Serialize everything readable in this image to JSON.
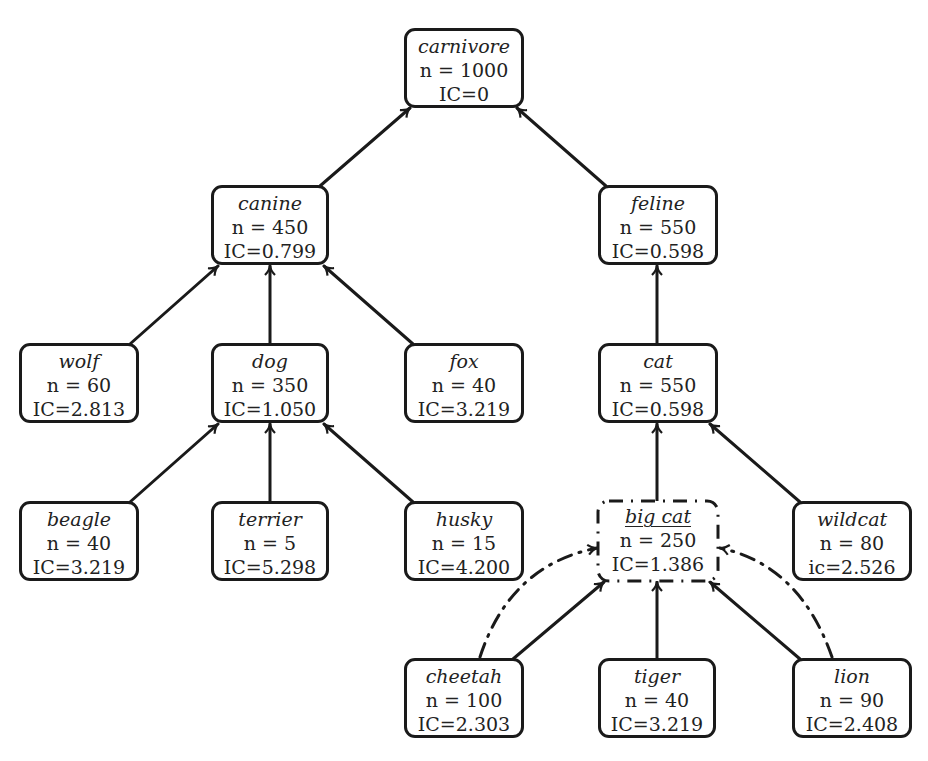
{
  "diagram": {
    "nodes": {
      "carnivore": {
        "name": "carnivore",
        "n": "n = 1000",
        "ic": "IC=0"
      },
      "canine": {
        "name": "canine",
        "n": "n = 450",
        "ic": "IC=0.799"
      },
      "feline": {
        "name": "feline",
        "n": "n = 550",
        "ic": "IC=0.598"
      },
      "wolf": {
        "name": "wolf",
        "n": "n = 60",
        "ic": "IC=2.813"
      },
      "dog": {
        "name": "dog",
        "n": "n = 350",
        "ic": "IC=1.050"
      },
      "fox": {
        "name": "fox",
        "n": "n = 40",
        "ic": "IC=3.219"
      },
      "cat": {
        "name": "cat",
        "n": "n = 550",
        "ic": "IC=0.598"
      },
      "beagle": {
        "name": "beagle",
        "n": "n = 40",
        "ic": "IC=3.219"
      },
      "terrier": {
        "name": "terrier",
        "n": "n = 5",
        "ic": "IC=5.298"
      },
      "husky": {
        "name": "husky",
        "n": "n = 15",
        "ic": "IC=4.200"
      },
      "big_cat": {
        "name": "big cat",
        "n": "n = 250",
        "ic": "IC=1.386"
      },
      "wildcat": {
        "name": "wildcat",
        "n": "n = 80",
        "ic": "ic=2.526"
      },
      "cheetah": {
        "name": "cheetah",
        "n": "n = 100",
        "ic": "IC=2.303"
      },
      "tiger": {
        "name": "tiger",
        "n": "n = 40",
        "ic": "IC=3.219"
      },
      "lion": {
        "name": "lion",
        "n": "n = 90",
        "ic": "IC=2.408"
      }
    },
    "edges": [
      {
        "from": "canine",
        "to": "carnivore",
        "style": "solid"
      },
      {
        "from": "feline",
        "to": "carnivore",
        "style": "solid"
      },
      {
        "from": "wolf",
        "to": "canine",
        "style": "solid"
      },
      {
        "from": "dog",
        "to": "canine",
        "style": "solid"
      },
      {
        "from": "fox",
        "to": "canine",
        "style": "solid"
      },
      {
        "from": "cat",
        "to": "feline",
        "style": "solid"
      },
      {
        "from": "beagle",
        "to": "dog",
        "style": "solid"
      },
      {
        "from": "terrier",
        "to": "dog",
        "style": "solid"
      },
      {
        "from": "husky",
        "to": "dog",
        "style": "solid"
      },
      {
        "from": "big_cat",
        "to": "cat",
        "style": "solid"
      },
      {
        "from": "wildcat",
        "to": "cat",
        "style": "solid"
      },
      {
        "from": "cheetah",
        "to": "big_cat",
        "style": "solid"
      },
      {
        "from": "tiger",
        "to": "big_cat",
        "style": "solid"
      },
      {
        "from": "lion",
        "to": "big_cat",
        "style": "solid"
      },
      {
        "from": "cheetah",
        "to": "big_cat",
        "style": "dash-dot-curved"
      },
      {
        "from": "lion",
        "to": "big_cat",
        "style": "dash-dot-curved"
      }
    ],
    "colors": {
      "stroke": "#1a1a1a",
      "text": "#222222",
      "background": "#ffffff"
    }
  }
}
